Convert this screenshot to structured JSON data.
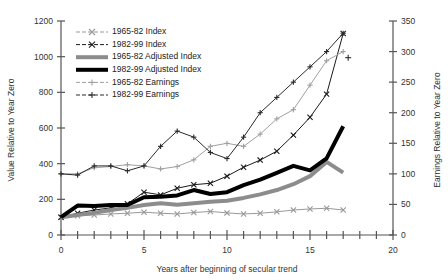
{
  "chart_data": {
    "type": "line",
    "title": "",
    "xlabel": "Years after beginning of secular trend",
    "ylabel": "Value Relative to Year Zero",
    "y2label": "Earnings Relative to Year Zero",
    "xlim": [
      0,
      20
    ],
    "ylim": [
      0,
      1200
    ],
    "y2lim": [
      0,
      350
    ],
    "xticks": [
      0,
      1,
      2,
      3,
      4,
      5,
      6,
      7,
      8,
      9,
      10,
      11,
      12,
      13,
      14,
      15,
      16,
      17,
      18,
      19,
      20
    ],
    "xtick_labels": [
      "0",
      "",
      "",
      "",
      "",
      "5",
      "",
      "",
      "",
      "",
      "10",
      "",
      "",
      "",
      "",
      "15",
      "",
      "",
      "",
      "",
      "20"
    ],
    "yticks": [
      0,
      200,
      400,
      600,
      800,
      1000,
      1200
    ],
    "ytick_labels": [
      "0",
      "200",
      "400",
      "600",
      "800",
      "1000",
      "1200"
    ],
    "y2ticks": [
      0,
      50,
      100,
      150,
      200,
      250,
      300,
      350
    ],
    "y2tick_labels": [
      "0",
      "50",
      "100",
      "150",
      "200",
      "250",
      "300",
      "350"
    ],
    "grid": false,
    "legend_position": "top-left-inside",
    "series": [
      {
        "name": "1965-82 Index",
        "axis": "left",
        "color": "#999999",
        "marker": "x",
        "width": 1,
        "x": [
          0,
          1,
          2,
          3,
          4,
          5,
          6,
          7,
          8,
          9,
          10,
          11,
          12,
          13,
          14,
          15,
          16,
          17
        ],
        "values": [
          100,
          108,
          112,
          118,
          122,
          128,
          122,
          118,
          126,
          132,
          124,
          118,
          122,
          130,
          140,
          146,
          150,
          140
        ]
      },
      {
        "name": "1982-99 Index",
        "axis": "left",
        "color": "#1a1a1a",
        "marker": "x",
        "width": 1,
        "x": [
          0,
          1,
          2,
          3,
          4,
          5,
          6,
          7,
          8,
          9,
          10,
          11,
          12,
          13,
          14,
          15,
          16,
          17
        ],
        "values": [
          100,
          122,
          140,
          152,
          175,
          240,
          225,
          262,
          282,
          290,
          330,
          380,
          420,
          470,
          560,
          660,
          790,
          1130
        ]
      },
      {
        "name": "1965-82 Adjusted Index",
        "axis": "left",
        "color": "#8c8c8c",
        "marker": "none",
        "width": 4,
        "x": [
          0,
          1,
          2,
          3,
          4,
          5,
          6,
          7,
          8,
          9,
          10,
          11,
          12,
          13,
          14,
          15,
          16,
          17
        ],
        "values": [
          100,
          112,
          124,
          140,
          152,
          168,
          178,
          170,
          178,
          186,
          192,
          208,
          228,
          252,
          285,
          330,
          410,
          350
        ]
      },
      {
        "name": "1982-99 Adjusted Index",
        "axis": "left",
        "color": "#000000",
        "marker": "none",
        "width": 4,
        "x": [
          0,
          1,
          2,
          3,
          4,
          5,
          6,
          7,
          8,
          9,
          10,
          11,
          12,
          13,
          14,
          15,
          16,
          17
        ],
        "values": [
          100,
          165,
          162,
          168,
          168,
          212,
          215,
          222,
          252,
          230,
          240,
          280,
          310,
          348,
          388,
          362,
          430,
          610
        ]
      },
      {
        "name": "1965-82 Earnings",
        "axis": "right",
        "color": "#a0a0a0",
        "marker": "plus",
        "width": 1,
        "x": [
          0,
          1,
          2,
          3,
          4,
          5,
          6,
          7,
          8,
          9,
          10,
          11,
          12,
          13,
          14,
          15,
          16,
          17
        ],
        "values": [
          100,
          100,
          110,
          112,
          115,
          113,
          108,
          112,
          123,
          145,
          150,
          145,
          165,
          190,
          205,
          245,
          285,
          300
        ]
      },
      {
        "name": "1982-99 Earnings",
        "axis": "right",
        "color": "#2b2b2b",
        "marker": "plus",
        "width": 1,
        "x": [
          0,
          1,
          2,
          3,
          4,
          5,
          6,
          7,
          8,
          9,
          10,
          11,
          12,
          13,
          14,
          15,
          16,
          17
        ],
        "values": [
          100,
          98,
          113,
          113,
          105,
          113,
          145,
          170,
          160,
          135,
          125,
          160,
          200,
          225,
          250,
          275,
          300,
          330
        ]
      }
    ],
    "annotations": [
      {
        "label": "stray-earnings-point",
        "x": 17.3,
        "axis": "right",
        "value": 290,
        "marker": "plus",
        "color": "#2b2b2b"
      }
    ]
  },
  "legend": {
    "items": [
      {
        "label": "1965-82 Index"
      },
      {
        "label": "1982-99 Index"
      },
      {
        "label": "1965-82 Adjusted Index"
      },
      {
        "label": "1982-99 Adjusted Index"
      },
      {
        "label": "1965-82 Earnings"
      },
      {
        "label": "1982-99 Earnings"
      }
    ]
  }
}
